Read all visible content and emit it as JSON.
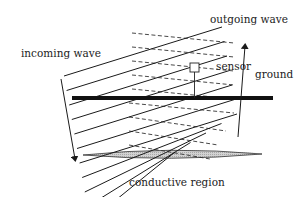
{
  "labels": {
    "incoming": "incoming wave",
    "outgoing": "outgoing wave",
    "sensor": "sensor",
    "ground": "ground",
    "conductive": "conductive region"
  },
  "colors": {
    "ink": "#1a1a1a",
    "ground": "#111111",
    "region_fill": "#c8c8c8"
  },
  "counts": {
    "incoming_wavefronts": 11,
    "outgoing_wavefronts": 9
  }
}
